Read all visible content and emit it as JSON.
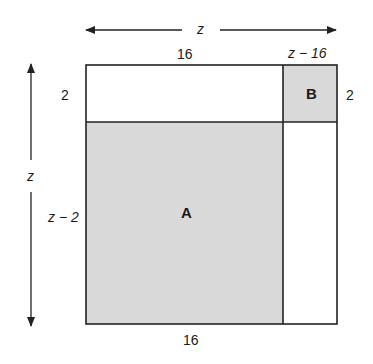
{
  "diagram": {
    "type": "area-decomposition",
    "colors": {
      "shaded": "#d9d9d9",
      "line": "#222222",
      "background": "#ffffff"
    },
    "dimensions": {
      "top_arrow_label": "z",
      "left_arrow_label": "z",
      "top_left_width": "16",
      "top_right_width": "z − 16",
      "left_top_height": "2",
      "right_top_height": "2",
      "left_bottom_height": "z − 2",
      "bottom_width": "16"
    },
    "regions": [
      {
        "id": "A",
        "label": "A",
        "shaded": true
      },
      {
        "id": "B",
        "label": "B",
        "shaded": true
      }
    ]
  }
}
